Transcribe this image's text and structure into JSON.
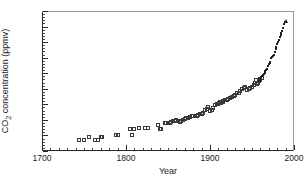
{
  "chart_data": {
    "type": "scatter",
    "title": "",
    "xlabel": "Year",
    "ylabel": "CO₂ concentration (ppmv)",
    "ylabel_base": "CO",
    "ylabel_sub": "2",
    "ylabel_rest": " concentration (ppmv)",
    "xlim": [
      1700,
      2000
    ],
    "ylim": [
      270,
      360
    ],
    "xticks": [
      1700,
      1800,
      1900,
      2000
    ],
    "xticklabels": [
      "1700",
      "1800",
      "1900",
      "2000"
    ],
    "x_minor_step": 10,
    "yticks": [
      270,
      280,
      290,
      300,
      310,
      320,
      330,
      340,
      350,
      360
    ],
    "yticklabels": [
      "270",
      "280",
      "290",
      "300",
      "310",
      "320",
      "330",
      "340",
      "350",
      "360"
    ],
    "y_minor_step": 2,
    "grid": false,
    "legend": null,
    "marker_color": "#2f2f2f",
    "axis_color": "#2b2b2b",
    "background": "#ffffff",
    "series": [
      {
        "name": "Ice core record",
        "marker": "open-square",
        "points": [
          [
            1744,
            277.0
          ],
          [
            1750,
            277.2
          ],
          [
            1756,
            279.0
          ],
          [
            1763,
            276.9
          ],
          [
            1767,
            277.2
          ],
          [
            1770,
            279.0
          ],
          [
            1772,
            279.1
          ],
          [
            1788,
            280.2
          ],
          [
            1790,
            280.4
          ],
          [
            1805,
            284.2
          ],
          [
            1807,
            280.1
          ],
          [
            1809,
            284.3
          ],
          [
            1816,
            284.6
          ],
          [
            1823,
            284.6
          ],
          [
            1826,
            284.7
          ],
          [
            1838,
            286.6
          ],
          [
            1840,
            284.0
          ],
          [
            1842,
            284.1
          ],
          [
            1846,
            287.8
          ],
          [
            1848,
            288.0
          ],
          [
            1850,
            287.9
          ],
          [
            1852,
            288.2
          ],
          [
            1854,
            288.6
          ],
          [
            1856,
            289.0
          ],
          [
            1858,
            289.4
          ],
          [
            1860,
            290.0
          ],
          [
            1862,
            289.2
          ],
          [
            1864,
            288.9
          ],
          [
            1866,
            289.1
          ],
          [
            1868,
            290.2
          ],
          [
            1870,
            290.6
          ],
          [
            1872,
            291.0
          ],
          [
            1874,
            291.3
          ],
          [
            1876,
            291.8
          ],
          [
            1878,
            292.2
          ],
          [
            1880,
            292.6
          ],
          [
            1882,
            292.3
          ],
          [
            1884,
            292.8
          ],
          [
            1886,
            293.3
          ],
          [
            1888,
            293.6
          ],
          [
            1890,
            294.0
          ],
          [
            1892,
            294.2
          ],
          [
            1894,
            296.5
          ],
          [
            1896,
            297.2
          ],
          [
            1898,
            298.4
          ],
          [
            1900,
            295.8
          ],
          [
            1902,
            296.3
          ],
          [
            1904,
            297.6
          ],
          [
            1906,
            299.7
          ],
          [
            1908,
            300.0
          ],
          [
            1910,
            300.4
          ],
          [
            1911,
            300.8
          ],
          [
            1912,
            301.2
          ],
          [
            1913,
            301.0
          ],
          [
            1914,
            301.4
          ],
          [
            1915,
            301.7
          ],
          [
            1916,
            302.0
          ],
          [
            1918,
            302.6
          ],
          [
            1920,
            303.0
          ],
          [
            1922,
            303.3
          ],
          [
            1924,
            303.9
          ],
          [
            1926,
            304.4
          ],
          [
            1928,
            305.2
          ],
          [
            1930,
            306.2
          ],
          [
            1932,
            307.0
          ],
          [
            1934,
            307.6
          ],
          [
            1936,
            308.4
          ],
          [
            1938,
            309.6
          ],
          [
            1940,
            310.6
          ],
          [
            1942,
            311.2
          ],
          [
            1944,
            308.9
          ],
          [
            1946,
            309.6
          ],
          [
            1948,
            310.2
          ],
          [
            1950,
            311.3
          ],
          [
            1952,
            312.5
          ],
          [
            1954,
            313.6
          ],
          [
            1955,
            315.8
          ],
          [
            1956,
            313.2
          ],
          [
            1957,
            314.0
          ],
          [
            1958,
            315.0
          ],
          [
            1959,
            315.9
          ],
          [
            1960,
            316.5
          ],
          [
            1962,
            317.2
          ]
        ]
      },
      {
        "name": "Mauna Loa record",
        "marker": "small-open-square",
        "points": [
          [
            1958,
            315.3
          ],
          [
            1959,
            315.9
          ],
          [
            1960,
            316.9
          ],
          [
            1961,
            317.6
          ],
          [
            1962,
            318.4
          ],
          [
            1963,
            318.9
          ],
          [
            1964,
            319.6
          ],
          [
            1965,
            320.0
          ],
          [
            1966,
            321.4
          ],
          [
            1967,
            322.2
          ],
          [
            1968,
            323.0
          ],
          [
            1969,
            324.6
          ],
          [
            1970,
            325.7
          ],
          [
            1971,
            326.3
          ],
          [
            1972,
            327.5
          ],
          [
            1973,
            329.7
          ],
          [
            1974,
            330.2
          ],
          [
            1975,
            331.1
          ],
          [
            1976,
            332.0
          ],
          [
            1977,
            333.8
          ],
          [
            1978,
            335.4
          ],
          [
            1979,
            336.8
          ],
          [
            1980,
            338.7
          ],
          [
            1981,
            340.1
          ],
          [
            1982,
            341.4
          ],
          [
            1983,
            343.0
          ],
          [
            1984,
            344.6
          ],
          [
            1985,
            346.0
          ],
          [
            1986,
            347.4
          ],
          [
            1987,
            349.2
          ],
          [
            1988,
            351.5
          ],
          [
            1989,
            352.9
          ]
        ]
      },
      {
        "name": "Latest observation",
        "marker": "triangle",
        "points": [
          [
            1990,
            353.5
          ]
        ]
      }
    ]
  }
}
